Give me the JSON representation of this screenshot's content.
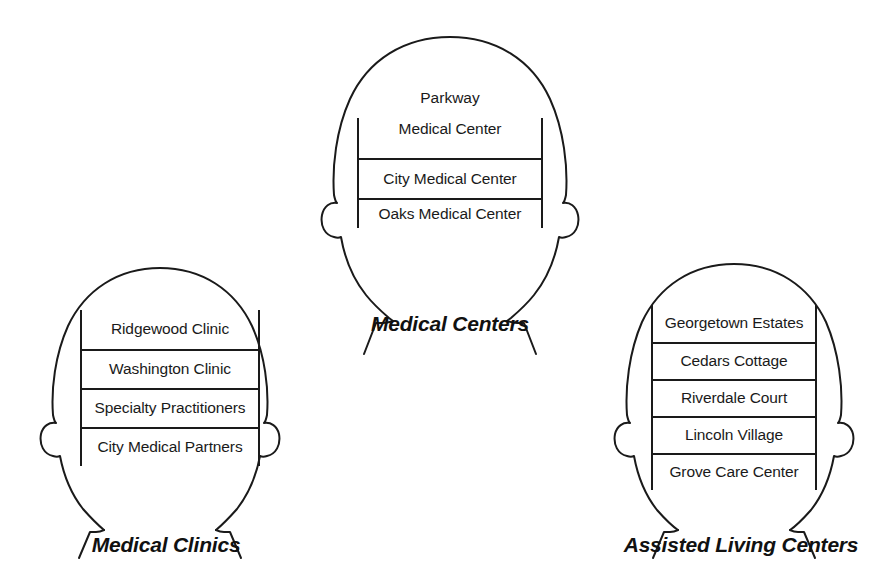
{
  "diagram": {
    "title_style": "bold-italic",
    "line_color": "#1a1a1a",
    "background_color": "#ffffff",
    "heads": [
      {
        "id": "medical-clinics",
        "caption": "Medical Clinics",
        "rows": [
          "Ridgewood Clinic",
          "Washington Clinic",
          "Specialty Practitioners",
          "City Medical Partners"
        ]
      },
      {
        "id": "medical-centers",
        "caption": "Medical Centers",
        "rows": [
          "Parkway Medical Center",
          "City Medical Center",
          "Oaks Medical Center"
        ],
        "first_row_line_1": "Parkway",
        "first_row_line_2": "Medical Center"
      },
      {
        "id": "assisted-living-centers",
        "caption": "Assisted Living Centers",
        "rows": [
          "Georgetown Estates",
          "Cedars Cottage",
          "Riverdale Court",
          "Lincoln Village",
          "Grove Care Center"
        ]
      }
    ]
  }
}
